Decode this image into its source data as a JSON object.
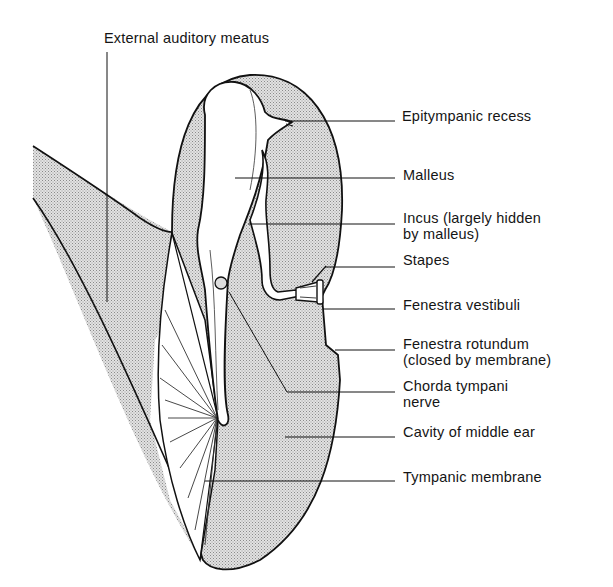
{
  "diagram": {
    "labels": {
      "external_auditory_meatus": "External auditory meatus",
      "epitympanic_recess": "Epitympanic recess",
      "malleus": "Malleus",
      "incus_line1": "Incus (largely hidden",
      "incus_line2": "by malleus)",
      "stapes": "Stapes",
      "fenestra_vestibuli": "Fenestra vestibuli",
      "fenestra_rotundum_line1": "Fenestra rotundum",
      "fenestra_rotundum_line2": "(closed by membrane)",
      "chorda_tympani_line1": "Chorda tympani",
      "chorda_tympani_line2": "nerve",
      "cavity_middle_ear": "Cavity of middle ear",
      "tympanic_membrane": "Tympanic membrane"
    },
    "colors": {
      "ink": "#111111",
      "shade_dot": "#8a8a8a",
      "background": "#ffffff"
    }
  }
}
